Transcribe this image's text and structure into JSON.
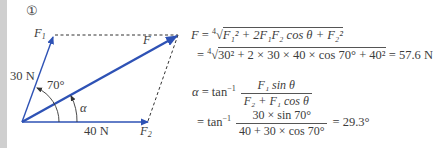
{
  "figure_number": "①",
  "diagram": {
    "labels": {
      "F1": "F",
      "F1_sub": "1",
      "F2": "F",
      "F2_sub": "2",
      "F": "F",
      "f1_magnitude": "30 N",
      "f2_magnitude": "40 N",
      "angle_theta": "70°",
      "angle_alpha": "α"
    },
    "colors": {
      "vector": "#2e52b5",
      "dashed": "#333333",
      "text": "#3a3a3a"
    }
  },
  "equations": {
    "resultant_formula": {
      "lhs": "F",
      "eq": " = ",
      "root_index": "4",
      "terms": "F₁² + 2F₁F₂ cos θ + F₂²"
    },
    "resultant_value": {
      "eq": " = ",
      "root_index": "4",
      "terms": "30² + 2 × 30 × 40 × cos 70° + 40²",
      "result": " =  57.6 N"
    },
    "alpha_formula": {
      "lhs": "α",
      "eq": " = tan",
      "inv": "−1",
      "numerator": "F₁ sin θ",
      "denominator": "F₂ + F₁ cos θ"
    },
    "alpha_value": {
      "eq": " = tan",
      "inv": "−1",
      "numerator": "30 × sin 70°",
      "denominator": "40 + 30 × cos 70°",
      "result": " =  29.3°"
    }
  }
}
